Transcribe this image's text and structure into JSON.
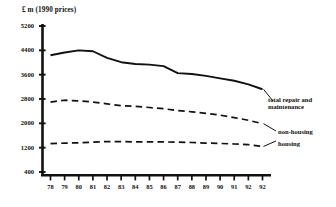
{
  "chart_data": {
    "type": "line",
    "title": "£ m  (1990 prices)",
    "xlabel": "",
    "ylabel": "£ m (1990 prices)",
    "ylim": [
      400,
      5200
    ],
    "yticks": [
      400,
      1200,
      2000,
      2800,
      3600,
      4400,
      5200
    ],
    "ytick_labels": [
      "400",
      "1200",
      "2000",
      "2800",
      "3600",
      "4400",
      "5200"
    ],
    "grid": false,
    "legend_position": "right-inline-annotations",
    "categories": [
      "78",
      "79",
      "80",
      "81",
      "82",
      "83",
      "84",
      "85",
      "86",
      "87",
      "88",
      "89",
      "90",
      "91",
      "92",
      "92"
    ],
    "series": [
      {
        "name": "total repair and maintenance",
        "style": "solid",
        "values": [
          4240,
          4330,
          4400,
          4370,
          4150,
          4010,
          3950,
          3930,
          3880,
          3650,
          3620,
          3560,
          3480,
          3400,
          3280,
          3120
        ]
      },
      {
        "name": "non-housing",
        "style": "dashed",
        "values": [
          2700,
          2760,
          2740,
          2700,
          2640,
          2580,
          2560,
          2520,
          2480,
          2420,
          2380,
          2330,
          2270,
          2190,
          2100,
          1990
        ]
      },
      {
        "name": "housing",
        "style": "dashed",
        "values": [
          1330,
          1350,
          1360,
          1380,
          1400,
          1400,
          1390,
          1390,
          1390,
          1380,
          1370,
          1350,
          1340,
          1320,
          1300,
          1240
        ]
      }
    ],
    "annotations": [
      {
        "name": "total repair and maintenance",
        "text": "total repair and\nmaintenance"
      },
      {
        "name": "non-housing",
        "text": "non-housing"
      },
      {
        "name": "housing",
        "text": "housing"
      }
    ]
  },
  "axes": {
    "title_text": "£ m  (1990 prices)"
  }
}
